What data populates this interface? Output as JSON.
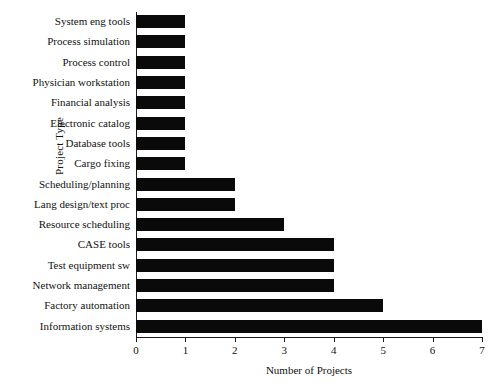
{
  "chart_data": {
    "type": "bar",
    "orientation": "horizontal",
    "title": "",
    "xlabel": "Number of Projects",
    "ylabel": "Project Type",
    "xlim": [
      0,
      7
    ],
    "xticks": [
      "0",
      "1",
      "2",
      "3",
      "4",
      "5",
      "6",
      "7"
    ],
    "grid": false,
    "legend": null,
    "bar_color": "#0a0a0a",
    "categories": [
      "System eng tools",
      "Process simulation",
      "Process control",
      "Physician workstation",
      "Financial analysis",
      "Electronic catalog",
      "Database tools",
      "Cargo fixing",
      "Scheduling/planning",
      "Lang design/text proc",
      "Resource scheduling",
      "CASE tools",
      "Test equipment sw",
      "Network management",
      "Factory automation",
      "Information systems"
    ],
    "values": [
      1,
      1,
      1,
      1,
      1,
      1,
      1,
      1,
      2,
      2,
      3,
      4,
      4,
      4,
      5,
      7
    ]
  },
  "caption": {
    "fragment": ""
  }
}
